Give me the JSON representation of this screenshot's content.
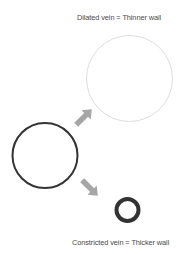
{
  "diagram": {
    "labels": {
      "dilated": "Dilated vein = Thinner wall",
      "constricted": "Constricted vein = Thicker wall"
    },
    "nodes": [
      {
        "id": "normal-vein",
        "cx": 45,
        "cy": 155.5,
        "r": 32.5,
        "stroke_width": 2,
        "stroke": "#333333"
      },
      {
        "id": "dilated-vein",
        "cx": 129.5,
        "cy": 78.5,
        "r": 43,
        "stroke_width": 0.8,
        "stroke": "#d4d4d4"
      },
      {
        "id": "constricted-vein",
        "cx": 127.5,
        "cy": 210,
        "r": 11,
        "stroke_width": 4,
        "stroke": "#333333"
      }
    ],
    "arrows": [
      {
        "id": "arrow-to-dilated",
        "from": "normal-vein",
        "to": "dilated-vein",
        "direction": "up-right",
        "color": "#a6a6a6"
      },
      {
        "id": "arrow-to-constricted",
        "from": "normal-vein",
        "to": "constricted-vein",
        "direction": "down-right",
        "color": "#a6a6a6"
      }
    ]
  }
}
